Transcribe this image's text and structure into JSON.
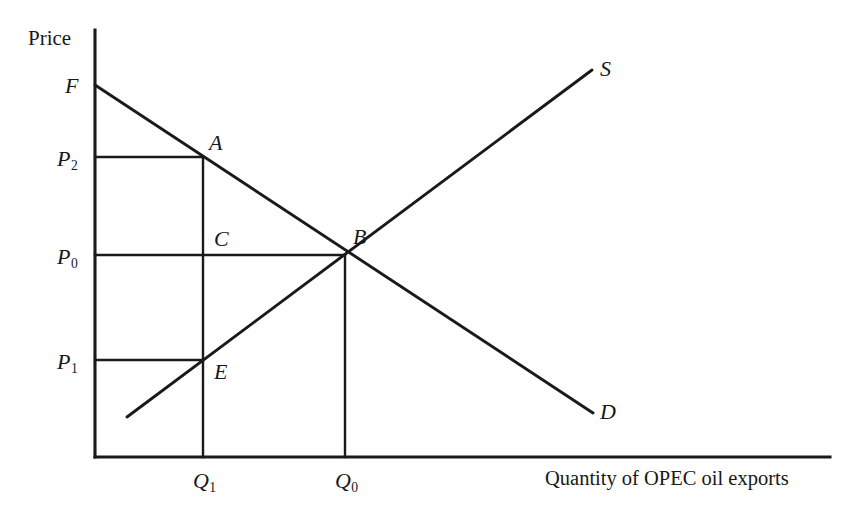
{
  "figure": {
    "type": "economics-supply-demand-diagram",
    "background_color": "#ffffff",
    "line_color": "#1a1a1a",
    "axes": {
      "y_axis_label": "Price",
      "x_axis_label": "Quantity of OPEC oil exports",
      "origin": {
        "x": 95,
        "y": 457
      },
      "y_axis_top": 30,
      "x_axis_right": 830
    },
    "price_ticks": [
      {
        "label": "P",
        "sub": "2",
        "y": 157,
        "line_to_x": 203
      },
      {
        "label": "P",
        "sub": "0",
        "y": 255,
        "line_to_x": 345
      },
      {
        "label": "P",
        "sub": "1",
        "y": 360,
        "line_to_x": 203
      }
    ],
    "quantity_ticks": [
      {
        "label": "Q",
        "sub": "1",
        "x": 203,
        "line_from_y": 157
      },
      {
        "label": "Q",
        "sub": "0",
        "x": 345,
        "line_from_y": 255
      }
    ],
    "points": [
      {
        "name": "F",
        "x": 95,
        "y": 85,
        "label_x": 65,
        "label_y": 75
      },
      {
        "name": "A",
        "x": 203,
        "y": 157,
        "label_x": 209,
        "label_y": 132
      },
      {
        "name": "C",
        "x": 203,
        "y": 255,
        "label_x": 214,
        "label_y": 228
      },
      {
        "name": "B",
        "x": 345,
        "y": 255,
        "label_x": 353,
        "label_y": 226
      },
      {
        "name": "E",
        "x": 203,
        "y": 360,
        "label_x": 214,
        "label_y": 361
      }
    ],
    "curves": [
      {
        "name": "D",
        "label": "D",
        "role": "demand",
        "x1": 95,
        "y1": 85,
        "x2": 593,
        "y2": 413,
        "label_x": 600,
        "label_y": 401
      },
      {
        "name": "S",
        "label": "S",
        "role": "supply",
        "x1": 127,
        "y1": 417,
        "x2": 592,
        "y2": 70,
        "label_x": 600,
        "label_y": 58
      }
    ]
  },
  "chart_data": {
    "type": "line",
    "title": "",
    "xlabel": "Quantity of OPEC oil exports",
    "ylabel": "Price",
    "grid": false,
    "legend": "inline-curve-labels",
    "xlim": [
      0,
      1
    ],
    "ylim": [
      0,
      1
    ],
    "xticks": [
      "Q1",
      "Q0"
    ],
    "yticks": [
      "P2",
      "P0",
      "P1"
    ],
    "series": [
      {
        "name": "D",
        "description": "Demand curve, downward sloping from F through A, B to D",
        "points": [
          {
            "x": 0.0,
            "y": 0.871
          },
          {
            "x": 0.147,
            "y": 0.702
          },
          {
            "x": 0.34,
            "y": 0.473
          },
          {
            "x": 0.677,
            "y": 0.103
          }
        ]
      },
      {
        "name": "S",
        "description": "Supply curve, upward sloping through E and B to S",
        "points": [
          {
            "x": 0.044,
            "y": 0.094
          },
          {
            "x": 0.147,
            "y": 0.227
          },
          {
            "x": 0.34,
            "y": 0.473
          },
          {
            "x": 0.676,
            "y": 0.906
          }
        ]
      }
    ],
    "annotations": [
      {
        "label": "F",
        "x": 0.0,
        "y": 0.871,
        "note": "demand curve intercept on price axis"
      },
      {
        "label": "A",
        "x": 0.147,
        "y": 0.702,
        "note": "demand at quantity Q1, price P2"
      },
      {
        "label": "C",
        "x": 0.147,
        "y": 0.473,
        "note": "point on Q1 vertical at price P0"
      },
      {
        "label": "B",
        "x": 0.34,
        "y": 0.473,
        "note": "equilibrium, price P0, quantity Q0"
      },
      {
        "label": "E",
        "x": 0.147,
        "y": 0.227,
        "note": "supply at quantity Q1, price P1"
      }
    ]
  }
}
